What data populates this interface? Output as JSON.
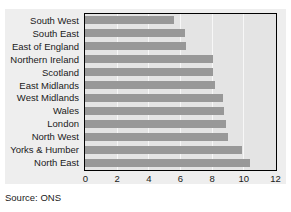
{
  "source_note": "Source: ONS",
  "colors": {
    "bar": "#989898",
    "plot_background": "#e4e4e4",
    "panel_background": "#eeeeee",
    "frame": "#000000",
    "gridline": "#f7f7f7",
    "text": "#1a1a1a"
  },
  "chart_data": {
    "type": "bar",
    "orientation": "horizontal",
    "title": "",
    "subtitle": "",
    "xlabel": "",
    "ylabel": "",
    "xlim": [
      0,
      12
    ],
    "xticks": [
      0,
      2,
      4,
      6,
      8,
      10,
      12
    ],
    "xticklabels": [
      "0",
      "2",
      "4",
      "6",
      "8",
      "10",
      "12"
    ],
    "grid": true,
    "grid_axis": "x",
    "legend": false,
    "legend_position": "none",
    "categories": [
      "South West",
      "South East",
      "East of England",
      "Northern Ireland",
      "Scotland",
      "East Midlands",
      "West Midlands",
      "Wales",
      "London",
      "North West",
      "Yorks & Humber",
      "North East"
    ],
    "values": [
      5.6,
      6.3,
      6.4,
      8.1,
      8.1,
      8.2,
      8.7,
      8.8,
      8.9,
      9.0,
      9.9,
      10.4
    ],
    "annotations": []
  }
}
